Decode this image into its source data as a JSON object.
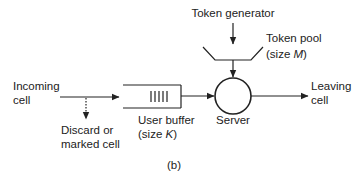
{
  "diagram": {
    "type": "token-bucket-queueing-model",
    "caption": "(b)",
    "labels": {
      "token_generator": "Token generator",
      "token_pool_line1": "Token pool",
      "token_pool_line2_prefix": "(size ",
      "token_pool_var": "M",
      "token_pool_line2_suffix": ")",
      "incoming_line1": "Incoming",
      "incoming_line2": "cell",
      "discard_line1": "Discard or",
      "discard_line2": "marked cell",
      "buffer_line1": "User buffer",
      "buffer_line2_prefix": "(size ",
      "buffer_var": "K",
      "buffer_line2_suffix": ")",
      "server": "Server",
      "leaving_line1": "Leaving",
      "leaving_line2": "cell"
    },
    "nodes": [
      {
        "id": "token-generator",
        "label": "Token generator"
      },
      {
        "id": "token-pool",
        "label": "Token pool (size M)"
      },
      {
        "id": "user-buffer",
        "label": "User buffer (size K)"
      },
      {
        "id": "server",
        "label": "Server"
      }
    ],
    "edges": [
      {
        "from": "incoming",
        "to": "user-buffer",
        "style": "solid"
      },
      {
        "from": "incoming",
        "to": "discard",
        "style": "dotted"
      },
      {
        "from": "user-buffer",
        "to": "server",
        "style": "solid"
      },
      {
        "from": "token-generator",
        "to": "token-pool",
        "style": "solid"
      },
      {
        "from": "token-pool",
        "to": "server",
        "style": "solid"
      },
      {
        "from": "server",
        "to": "leaving",
        "style": "solid"
      }
    ],
    "colors": {
      "stroke": "#222222",
      "background": "#ffffff"
    }
  }
}
